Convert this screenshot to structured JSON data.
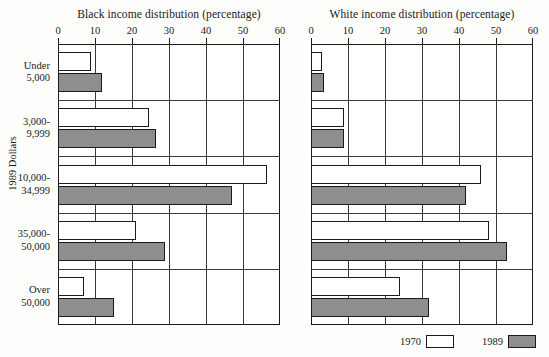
{
  "chart_data": {
    "type": "bar",
    "orientation": "horizontal",
    "title": "",
    "ylabel": "1989 Dollars",
    "categories": [
      "Under 5,000",
      "3,000-9,999",
      "10,000-34,999",
      "35,000-50,000",
      "Over 50,000"
    ],
    "category_lines": [
      [
        "Under",
        "5,000"
      ],
      [
        "3,000-",
        "9,999"
      ],
      [
        "10,000-",
        "34,999"
      ],
      [
        "35,000-",
        "50,000"
      ],
      [
        "Over",
        "50,000"
      ]
    ],
    "xlim": [
      0,
      60
    ],
    "xticks": [
      0,
      10,
      20,
      30,
      40,
      50,
      60
    ],
    "xtick_labels": [
      "0",
      "10",
      "20",
      "30",
      "40",
      "50",
      "60"
    ],
    "grid": true,
    "legend_position": "bottom-right",
    "legend": [
      "1970",
      "1989"
    ],
    "colors": {
      "1970": "#ffffff",
      "1989": "#8e8e8e",
      "outline": "#1a1a1a"
    },
    "panels": [
      {
        "id": "black",
        "title": "Black income distribution (percentage)",
        "xlabel": "Black income distribution (percentage)",
        "series": [
          {
            "name": "1970",
            "values": [
              9,
              24.5,
              56.5,
              21,
              7
            ]
          },
          {
            "name": "1989",
            "values": [
              12,
              26.5,
              47,
              29,
              15
            ]
          }
        ]
      },
      {
        "id": "white",
        "title": "White income distribution (percentage)",
        "xlabel": "White income distribution (percentage)",
        "series": [
          {
            "name": "1970",
            "values": [
              3,
              9,
              46,
              48,
              24
            ]
          },
          {
            "name": "1989",
            "values": [
              3.5,
              9,
              42,
              53,
              32
            ]
          }
        ]
      }
    ]
  }
}
